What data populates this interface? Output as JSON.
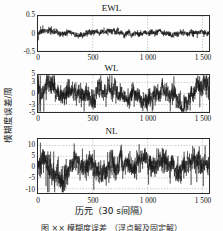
{
  "figure": {
    "ylabel": "模糊度误差/周",
    "xlabel": "历元（30 s间隔）",
    "caption": "图 ×× 模糊度误差 （浮点解及固定解）"
  },
  "chart_data": [
    {
      "type": "line",
      "title": "EWL",
      "xlabel": "",
      "ylabel": "模糊度误差/周",
      "xlim": [
        0,
        1560
      ],
      "ylim": [
        -0.5,
        0.5
      ],
      "xticks": [
        0,
        500,
        1000,
        1500
      ],
      "xticklabels": [
        "0",
        "500",
        "1 000",
        "1 500"
      ],
      "yticks": [
        -0.5,
        0,
        0.5
      ],
      "yticklabels": [
        "-0.5",
        "0",
        "0.5"
      ],
      "grid": true,
      "legend": null,
      "series": [
        {
          "name": "EWL ambiguity error",
          "noise_sigma": 0.035,
          "mean": 0.0,
          "n_points": 1560,
          "spike_scale": 0.11,
          "seed": 17
        }
      ]
    },
    {
      "type": "line",
      "title": "WL",
      "xlabel": "",
      "ylabel": "模糊度误差/周",
      "xlim": [
        0,
        1560
      ],
      "ylim": [
        -5,
        5
      ],
      "xticks": [
        0,
        500,
        1000,
        1500
      ],
      "xticklabels": [
        "0",
        "500",
        "1 000",
        "1 500"
      ],
      "yticks": [
        -5,
        -3,
        0,
        3,
        5
      ],
      "yticklabels": [
        "-5",
        "-3",
        "0",
        "3",
        "5"
      ],
      "grid": true,
      "legend": null,
      "series": [
        {
          "name": "WL ambiguity error",
          "noise_sigma": 1.15,
          "mean": 0.0,
          "n_points": 1560,
          "spike_scale": 3.6,
          "seed": 43
        }
      ]
    },
    {
      "type": "line",
      "title": "NL",
      "xlabel": "历元（30 s间隔）",
      "ylabel": "模糊度误差/周",
      "xlim": [
        0,
        1560
      ],
      "ylim": [
        -12,
        13
      ],
      "xticks": [
        0,
        500,
        1000,
        1500
      ],
      "xticklabels": [
        "0",
        "500",
        "1 000",
        "1 500"
      ],
      "yticks": [
        -10,
        -5,
        0,
        5,
        10
      ],
      "yticklabels": [
        "-10",
        "-5",
        "0",
        "5",
        "10"
      ],
      "grid": true,
      "legend": null,
      "series": [
        {
          "name": "NL ambiguity error",
          "noise_sigma": 2.3,
          "mean": 0.0,
          "n_points": 1560,
          "spike_scale": 8.5,
          "seed": 91
        }
      ]
    }
  ]
}
